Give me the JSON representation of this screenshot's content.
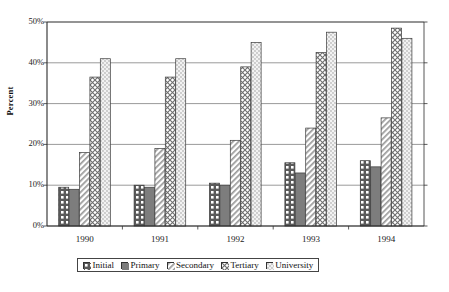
{
  "chart_data": {
    "type": "bar",
    "title": "",
    "subtitle": "",
    "xlabel": "",
    "ylabel": "Percent",
    "categories": [
      "1990",
      "1991",
      "1992",
      "1993",
      "1994"
    ],
    "ylim": [
      0,
      50
    ],
    "ytick_labels": [
      "0%",
      "10%",
      "20%",
      "30%",
      "40%",
      "50%"
    ],
    "ytick_values": [
      0,
      10,
      20,
      30,
      40,
      50
    ],
    "grid": true,
    "legend_position": "bottom",
    "series": [
      {
        "name": "Initial",
        "pattern": "checker-grid",
        "color": "#555555",
        "values": [
          9.5,
          10.0,
          10.5,
          15.5,
          16.0
        ]
      },
      {
        "name": "Primary",
        "pattern": "solid-gray",
        "color": "#7a7a7a",
        "values": [
          9.0,
          9.5,
          10.0,
          13.0,
          14.5
        ]
      },
      {
        "name": "Secondary",
        "pattern": "diagonal",
        "color": "#aaaaaa",
        "values": [
          18.0,
          19.0,
          21.0,
          24.0,
          26.5
        ]
      },
      {
        "name": "Tertiary",
        "pattern": "crosshatch",
        "color": "#888888",
        "values": [
          36.5,
          36.5,
          39.0,
          42.5,
          48.5
        ]
      },
      {
        "name": "University",
        "pattern": "stipple",
        "color": "#bbbbbb",
        "values": [
          41.0,
          41.0,
          45.0,
          47.5,
          46.0
        ]
      }
    ]
  },
  "legend": {
    "items": [
      {
        "label": "Initial"
      },
      {
        "label": "Primary"
      },
      {
        "label": "Secondary"
      },
      {
        "label": "Tertiary"
      },
      {
        "label": "University"
      }
    ]
  }
}
